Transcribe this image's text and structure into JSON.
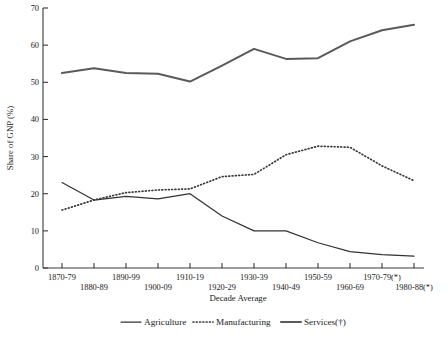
{
  "chart_data": {
    "type": "line",
    "title": "",
    "xlabel": "Decade Average",
    "ylabel": "Share of GNP (%)",
    "ylim": [
      0,
      70
    ],
    "yticks": [
      0,
      10,
      20,
      30,
      40,
      50,
      60,
      70
    ],
    "grid": false,
    "legend_position": "bottom",
    "categories": [
      "1870-79",
      "1880-89",
      "1890-99",
      "1900-09",
      "1910-19",
      "1920-29",
      "1930-39",
      "1940-49",
      "1950-59",
      "1960-69",
      "1970-79(*)",
      "1980-88(*)"
    ],
    "series": [
      {
        "name": "Agriculture",
        "style": "solid-thin",
        "values": [
          23.0,
          18.3,
          19.3,
          18.6,
          20.0,
          14.0,
          10.0,
          10.0,
          6.8,
          4.4,
          3.6,
          3.2
        ]
      },
      {
        "name": "Manufacturing",
        "style": "dotted",
        "values": [
          15.6,
          18.3,
          20.3,
          21.0,
          21.3,
          24.6,
          25.2,
          30.5,
          32.8,
          32.5,
          27.5,
          23.5
        ]
      },
      {
        "name": "Services(†)",
        "style": "solid-thick",
        "values": [
          52.5,
          53.8,
          52.5,
          52.3,
          50.2,
          54.5,
          59.0,
          56.3,
          56.5,
          61.0,
          64.0,
          65.5
        ]
      }
    ]
  },
  "axes": {
    "y_title": "Share of GNP (%)",
    "x_title": "Decade Average"
  },
  "legend": {
    "items": [
      {
        "label": "Agriculture"
      },
      {
        "label": "Manufacturing"
      },
      {
        "label": "Services(†)"
      }
    ]
  }
}
